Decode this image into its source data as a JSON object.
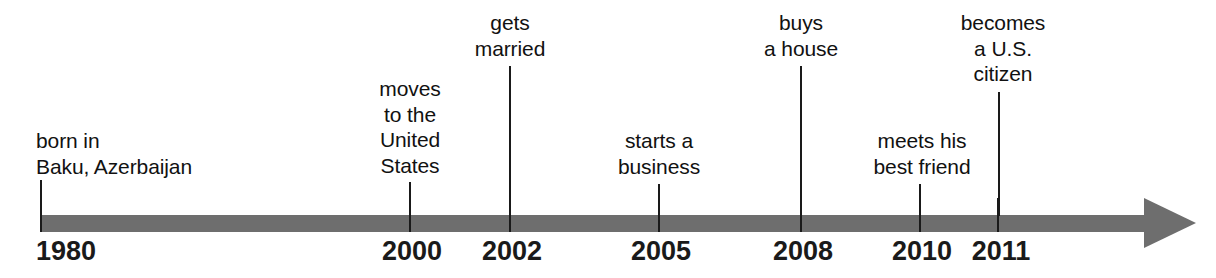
{
  "figure": {
    "type": "timeline",
    "title": "",
    "axis": {
      "color": "#6e6e6e",
      "start_x": 40,
      "end_x": 1196,
      "bar_top": 215,
      "bar_height": 17,
      "has_arrowhead": true,
      "arrow_direction": "right"
    },
    "tick_color": "#1a1a1a",
    "text_color": "#111111"
  },
  "events": [
    {
      "year": "1980",
      "tick_x": 41,
      "label_lines": [
        "born in",
        "Baku, Azerbaijan"
      ],
      "label_line1": "born in",
      "label_line2": "Baku, Azerbaijan",
      "label_top": 128,
      "stem_top": 180,
      "stem_height": 36,
      "label_align": "left",
      "label_x": 36,
      "year_align": "left",
      "year_x": 36
    },
    {
      "year": "2000",
      "tick_x": 410,
      "label_lines": [
        "moves",
        "to the",
        "United",
        "States"
      ],
      "label_line1": "moves",
      "label_line2": "to the",
      "label_line3": "United",
      "label_line4": "States",
      "label_top": 76,
      "stem_top": 182,
      "stem_height": 34,
      "label_align": "center",
      "label_x": 410,
      "year_align": "center",
      "year_x": 412
    },
    {
      "year": "2002",
      "tick_x": 510,
      "label_lines": [
        "gets",
        "married"
      ],
      "label_line1": "gets",
      "label_line2": "married",
      "label_top": 10,
      "stem_top": 66,
      "stem_height": 150,
      "label_align": "center",
      "label_x": 510,
      "year_align": "center",
      "year_x": 512
    },
    {
      "year": "2005",
      "tick_x": 659,
      "label_lines": [
        "starts a",
        "business"
      ],
      "label_line1": "starts a",
      "label_line2": "business",
      "label_top": 128,
      "stem_top": 184,
      "stem_height": 32,
      "label_align": "center",
      "label_x": 659,
      "year_align": "center",
      "year_x": 661
    },
    {
      "year": "2008",
      "tick_x": 801,
      "label_lines": [
        "buys",
        "a house"
      ],
      "label_line1": "buys",
      "label_line2": "a house",
      "label_top": 10,
      "stem_top": 66,
      "stem_height": 150,
      "label_align": "center",
      "label_x": 801,
      "year_align": "center",
      "year_x": 803
    },
    {
      "year": "2010",
      "tick_x": 920,
      "label_lines": [
        "meets his",
        "best friend"
      ],
      "label_line1": "meets his",
      "label_line2": "best friend",
      "label_top": 128,
      "stem_top": 184,
      "stem_height": 32,
      "label_align": "center",
      "label_x": 922,
      "year_align": "center",
      "year_x": 922
    },
    {
      "year": "2011",
      "tick_x": 999,
      "label_lines": [
        "becomes",
        "a U.S.",
        "citizen"
      ],
      "label_line1": "becomes",
      "label_line2": "a U.S.",
      "label_line3": "citizen",
      "label_top": 10,
      "stem_top": 92,
      "stem_height": 124,
      "label_align": "center",
      "label_x": 1003,
      "year_align": "center",
      "year_x": 1001
    }
  ]
}
